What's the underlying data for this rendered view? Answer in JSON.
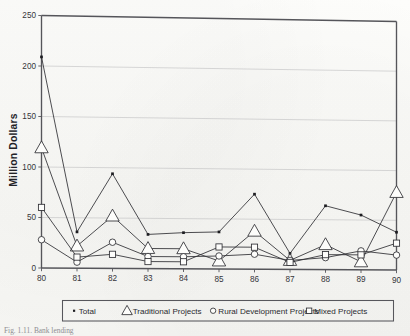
{
  "figure": {
    "caption": "Fig. 1.11. Bank lending"
  },
  "chart_data": {
    "type": "line",
    "title": "",
    "xlabel": "",
    "ylabel": "Million Dollars",
    "x": [
      "80",
      "81",
      "82",
      "83",
      "84",
      "85",
      "86",
      "87",
      "88",
      "89",
      "90"
    ],
    "xlim": [
      0,
      10
    ],
    "ylim": [
      0,
      250
    ],
    "yticks": [
      0,
      50,
      100,
      150,
      200,
      250
    ],
    "ytick_labels": [
      "0",
      "50",
      "100",
      "150",
      "200",
      "250"
    ],
    "grid": true,
    "grid_axis": "y",
    "legend_position": "below-axes",
    "series": [
      {
        "name": "Total",
        "marker": "filled-dot",
        "values": [
          209,
          36,
          94,
          34,
          36,
          37,
          75,
          16,
          64,
          55,
          38
        ]
      },
      {
        "name": "Traditional Projects",
        "marker": "open-triangle",
        "values": [
          119,
          22,
          52,
          20,
          20,
          8,
          38,
          9,
          25,
          8,
          78
        ]
      },
      {
        "name": "Rural Development Projects",
        "marker": "open-circle",
        "values": [
          28,
          6,
          26,
          12,
          12,
          13,
          15,
          9,
          12,
          19,
          15
        ]
      },
      {
        "name": "Mixed Projects",
        "marker": "open-square",
        "values": [
          60,
          11,
          14,
          7,
          7,
          22,
          22,
          7,
          15,
          15,
          27
        ]
      }
    ]
  },
  "legend": {
    "entries": [
      {
        "label": "Total",
        "marker": "filled-dot"
      },
      {
        "label": "Traditional Projects",
        "marker": "open-triangle"
      },
      {
        "label": "Rural Development Projects",
        "marker": "open-circle"
      },
      {
        "label": "Mixed Projects",
        "marker": "open-square"
      }
    ]
  }
}
